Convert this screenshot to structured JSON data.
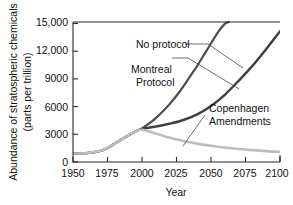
{
  "chart_data": {
    "type": "line",
    "title": "",
    "xlabel": "Year",
    "ylabel": "Abundance of stratospheric chemicals (parts per trillion)",
    "ylabel_line1": "Abundance of stratospheric chemicals",
    "ylabel_line2": "(parts per trillion)",
    "xlim": [
      1950,
      2100
    ],
    "ylim": [
      0,
      15000
    ],
    "grid": false,
    "legend_position": "inline-annotations",
    "xticks": [
      1950,
      1975,
      2000,
      2025,
      2050,
      2075,
      2100
    ],
    "xtick_labels": [
      "1950",
      "1975",
      "2000",
      "2025",
      "2050",
      "2075",
      "2100"
    ],
    "yticks": [
      0,
      3000,
      6000,
      9000,
      12000,
      15000
    ],
    "ytick_labels": [
      "0",
      "3000",
      "6000",
      "9000",
      "12,000",
      "15,000"
    ],
    "series": [
      {
        "name": "No protocol",
        "color": "#4d4d4d",
        "width": 2.2,
        "x": [
          1950,
          1960,
          1970,
          1975,
          1980,
          1985,
          1990,
          1995,
          2000,
          2005,
          2010,
          2015,
          2020,
          2025,
          2030,
          2035,
          2040,
          2045,
          2050,
          2055,
          2060,
          2063
        ],
        "values": [
          900,
          950,
          1200,
          1500,
          1950,
          2400,
          2850,
          3250,
          3600,
          4100,
          4700,
          5400,
          6200,
          7100,
          8100,
          9200,
          10300,
          11500,
          12700,
          13900,
          14800,
          15000
        ]
      },
      {
        "name": "Montreal Protocol",
        "color": "#3f3f3f",
        "width": 2.4,
        "x": [
          1950,
          1960,
          1970,
          1975,
          1980,
          1985,
          1990,
          1995,
          2000,
          2010,
          2020,
          2030,
          2040,
          2050,
          2060,
          2070,
          2080,
          2090,
          2100
        ],
        "values": [
          900,
          950,
          1200,
          1500,
          1950,
          2400,
          2850,
          3250,
          3550,
          3800,
          4100,
          4500,
          5100,
          6000,
          7200,
          8700,
          10300,
          12100,
          14000
        ]
      },
      {
        "name": "Copenhagen Amendments",
        "color": "#bdbdbd",
        "width": 2.6,
        "x": [
          1950,
          1960,
          1970,
          1975,
          1980,
          1985,
          1990,
          1995,
          2000,
          2010,
          2020,
          2030,
          2040,
          2050,
          2060,
          2070,
          2080,
          2090,
          2100
        ],
        "values": [
          900,
          950,
          1200,
          1500,
          1950,
          2400,
          2850,
          3250,
          3450,
          3050,
          2600,
          2250,
          1970,
          1750,
          1560,
          1400,
          1270,
          1160,
          1080
        ]
      }
    ],
    "annotations": [
      {
        "name": "no-protocol",
        "label": "No protocol",
        "x": 1987,
        "y": 12800
      },
      {
        "name": "montreal-protocol",
        "label_line1": "Montreal",
        "label_line2": "Protocol",
        "x": 1985,
        "y": 10200
      },
      {
        "name": "copenhagen-amendments",
        "label_line1": "Copenhagen",
        "label_line2": "Amendments",
        "x": 2048,
        "y": 5000
      }
    ]
  },
  "labels": {
    "xaxis_title": "Year",
    "yaxis_title_line1": "Abundance of stratospheric chemicals",
    "yaxis_title_line2": "(parts per trillion)",
    "ytick_0": "0",
    "ytick_3000": "3000",
    "ytick_6000": "6000",
    "ytick_9000": "9000",
    "ytick_12000": "12,000",
    "ytick_15000": "15,000",
    "xtick_1950": "1950",
    "xtick_1975": "1975",
    "xtick_2000": "2000",
    "xtick_2025": "2025",
    "xtick_2050": "2050",
    "xtick_2075": "2075",
    "xtick_2100": "2100",
    "ann_no_protocol": "No protocol",
    "ann_montreal_line1": "Montreal",
    "ann_montreal_line2": "Protocol",
    "ann_copenhagen_line1": "Copenhagen",
    "ann_copenhagen_line2": "Amendments"
  },
  "colors": {
    "no_protocol": "#4d4d4d",
    "montreal": "#3f3f3f",
    "copenhagen": "#bdbdbd",
    "axis": "#2b2b2b",
    "text": "#111111",
    "background": "#ffffff"
  }
}
